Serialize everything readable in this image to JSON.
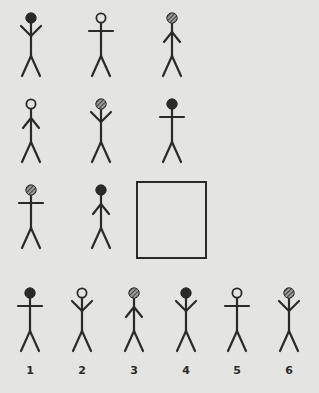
{
  "puzzle": {
    "type": "3x3 figure matrix with missing cell",
    "matrix": [
      [
        {
          "head": "black",
          "arms": "up"
        },
        {
          "head": "white",
          "arms": "horizontal"
        },
        {
          "head": "hatched",
          "arms": "down"
        }
      ],
      [
        {
          "head": "white",
          "arms": "down"
        },
        {
          "head": "hatched",
          "arms": "up"
        },
        {
          "head": "black",
          "arms": "horizontal"
        }
      ],
      [
        {
          "head": "hatched",
          "arms": "horizontal"
        },
        {
          "head": "black",
          "arms": "down"
        },
        null
      ]
    ],
    "missing_cell": "row 3, column 3 (empty square)",
    "options": [
      {
        "label": "1",
        "head": "black",
        "arms": "horizontal"
      },
      {
        "label": "2",
        "head": "white",
        "arms": "up"
      },
      {
        "label": "3",
        "head": "hatched",
        "arms": "down"
      },
      {
        "label": "4",
        "head": "black",
        "arms": "up"
      },
      {
        "label": "5",
        "head": "white",
        "arms": "horizontal"
      },
      {
        "label": "6",
        "head": "hatched",
        "arms": "up"
      }
    ]
  },
  "layout": {
    "matrix_positions": [
      [
        [
          31,
          10
        ],
        [
          101,
          10
        ],
        [
          172,
          10
        ]
      ],
      [
        [
          31,
          96
        ],
        [
          101,
          96
        ],
        [
          172,
          96
        ]
      ],
      [
        [
          31,
          182
        ],
        [
          101,
          182
        ]
      ]
    ],
    "option_positions": [
      [
        30,
        285
      ],
      [
        82,
        285
      ],
      [
        134,
        285
      ],
      [
        186,
        285
      ],
      [
        237,
        285
      ],
      [
        289,
        285
      ]
    ]
  },
  "colors": {
    "background": "#e4e4e2",
    "ink": "#2a2a2a",
    "white_head_fill": "#e4e4e2"
  }
}
